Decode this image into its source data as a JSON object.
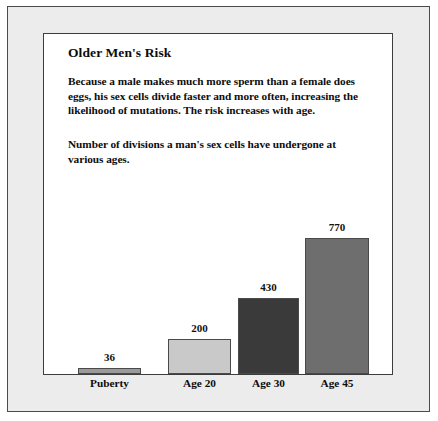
{
  "figure": {
    "title": "Older Men's Risk",
    "paragraph_1": "Because a male makes much more sperm than a female does eggs, his sex cells divide faster and more often, increasing the likelihood of mutations. The risk increases with age.",
    "paragraph_2": "Number of divisions a man's sex cells have undergone at various ages."
  },
  "chart_data": {
    "type": "bar",
    "title": "Older Men's Risk",
    "subtitle": "Number of divisions a man's sex cells have undergone at various ages.",
    "categories": [
      "Puberty",
      "Age 20",
      "Age 30",
      "Age 45"
    ],
    "values": [
      36,
      200,
      430,
      770
    ],
    "value_labels": [
      "36",
      "200",
      "430",
      "770"
    ],
    "xlabel": "",
    "ylabel": "Number of divisions",
    "ylim": [
      0,
      770
    ],
    "grid": false,
    "legend": "none",
    "bar_colors": [
      "#9a9a9a",
      "#c9c9c9",
      "#3a3a3a",
      "#6e6e6e"
    ],
    "bar_border_color": "#4a4a4a"
  },
  "style": {
    "mat_color": "#ececec",
    "panel_color": "#ffffff",
    "frame_border_color": "#4b4b4b",
    "panel_border_color": "#3c3c3c",
    "text_color": "#0d0d0d"
  }
}
